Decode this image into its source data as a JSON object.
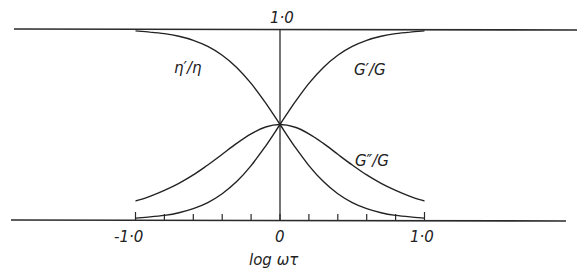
{
  "chart_data": {
    "type": "line",
    "title": "",
    "xlabel": "log ωτ",
    "ylabel": "",
    "xlim": [
      -1.0,
      1.0
    ],
    "ylim": [
      0,
      1.0
    ],
    "grid": false,
    "legend_position": "inline-labels",
    "x_tick_labels": [
      "-1·0",
      "0",
      "1·0"
    ],
    "x_ticks_minor_step": 0.2,
    "y_tick_labels": [
      "1·0"
    ],
    "x": [
      -1.0,
      -0.9,
      -0.8,
      -0.7,
      -0.6,
      -0.5,
      -0.4,
      -0.3,
      -0.2,
      -0.1,
      0.0,
      0.1,
      0.2,
      0.3,
      0.4,
      0.5,
      0.6,
      0.7,
      0.8,
      0.9,
      1.0
    ],
    "series": [
      {
        "name": "η′/η",
        "values": [
          0.99,
          0.984,
          0.976,
          0.962,
          0.941,
          0.909,
          0.863,
          0.799,
          0.715,
          0.613,
          0.5,
          0.387,
          0.285,
          0.201,
          0.137,
          0.091,
          0.059,
          0.038,
          0.024,
          0.016,
          0.01
        ]
      },
      {
        "name": "G′/G",
        "values": [
          0.01,
          0.016,
          0.024,
          0.038,
          0.059,
          0.091,
          0.137,
          0.201,
          0.285,
          0.387,
          0.5,
          0.613,
          0.715,
          0.799,
          0.863,
          0.909,
          0.941,
          0.962,
          0.976,
          0.984,
          0.99
        ]
      },
      {
        "name": "G″/G",
        "values": [
          0.099,
          0.124,
          0.155,
          0.192,
          0.236,
          0.288,
          0.344,
          0.401,
          0.451,
          0.487,
          0.5,
          0.487,
          0.451,
          0.401,
          0.344,
          0.288,
          0.236,
          0.192,
          0.155,
          0.124,
          0.099
        ]
      }
    ]
  },
  "labels": {
    "eta": "η′/η",
    "gprime": "G′/G",
    "gdoubleprime": "G″/G",
    "y_top": "1·0",
    "x_left": "-1·0",
    "x_center": "0",
    "x_right": "1·0",
    "x_axis_title": "log ωτ"
  }
}
